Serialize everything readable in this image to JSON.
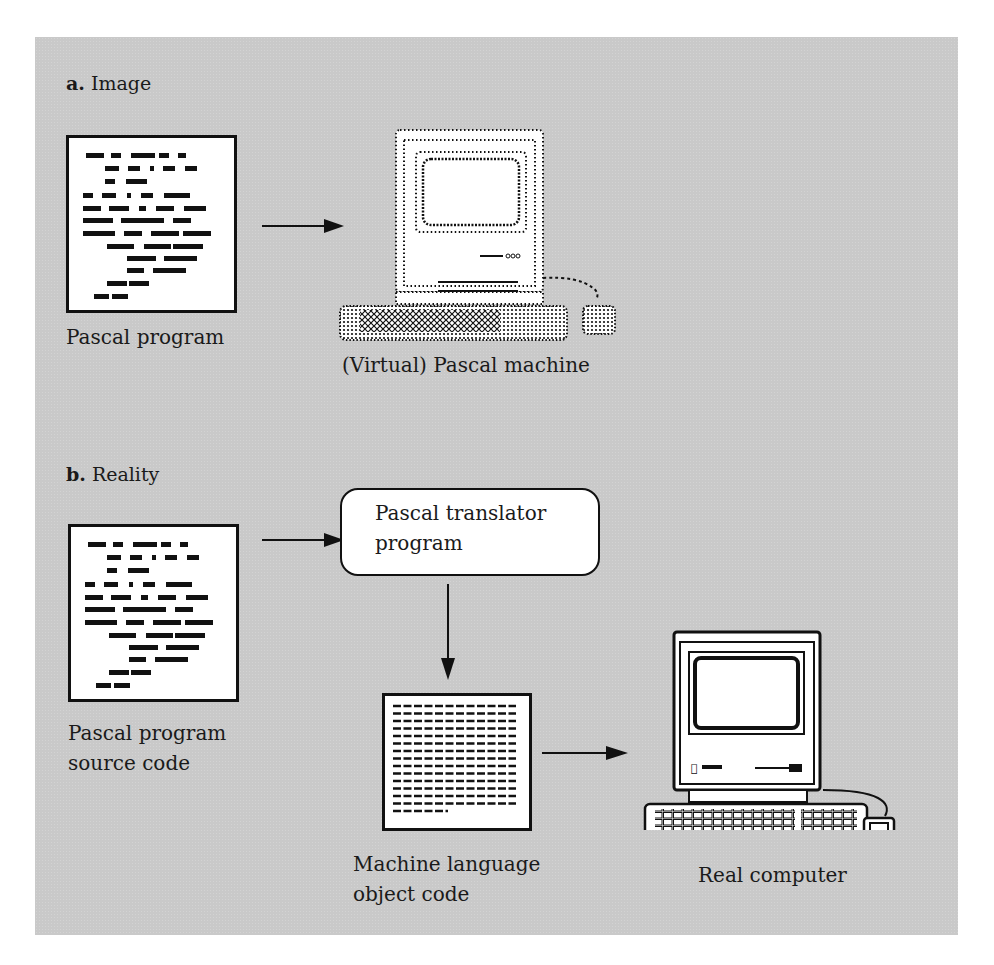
{
  "section_a": {
    "letter": "a.",
    "title": "Image",
    "source_caption": "Pascal program",
    "machine_caption": "(Virtual) Pascal machine"
  },
  "section_b": {
    "letter": "b.",
    "title": "Reality",
    "source_caption_line1": "Pascal program",
    "source_caption_line2": "source code",
    "translator_line1": "Pascal translator",
    "translator_line2": "program",
    "object_caption_line1": "Machine language",
    "object_caption_line2": "object code",
    "computer_caption": "Real computer"
  },
  "colors": {
    "panel_background": "#c9c9c9",
    "ink": "#111111",
    "paper": "#ffffff"
  },
  "icons": {
    "source_document": "document-icon",
    "virtual_computer": "dotted-computer-icon",
    "real_computer": "computer-icon",
    "object_code": "object-code-document-icon",
    "arrow": "arrow-right-icon"
  }
}
